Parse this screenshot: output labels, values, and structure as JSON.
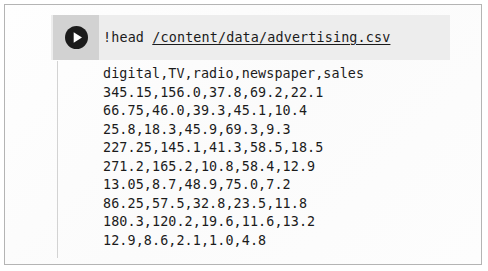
{
  "cell": {
    "run_button": {
      "icon": "play-icon",
      "label": "Run cell"
    },
    "code": {
      "command": "!head ",
      "path": "/content/data/advertising.csv",
      "full": "!head /content/data/advertising.csv"
    },
    "output": {
      "header_line": "digital,TV,radio,newspaper,sales",
      "lines": [
        "digital,TV,radio,newspaper,sales",
        "345.15,156.0,37.8,69.2,22.1",
        "66.75,46.0,39.3,45.1,10.4",
        "25.8,18.3,45.9,69.3,9.3",
        "227.25,145.1,41.3,58.5,18.5",
        "271.2,165.2,10.8,58.4,12.9",
        "13.05,8.7,48.9,75.0,7.2",
        "86.25,57.5,32.8,23.5,11.8",
        "180.3,120.2,19.6,11.6,13.2",
        "12.9,8.6,2.1,1.0,4.8"
      ],
      "columns": [
        "digital",
        "TV",
        "radio",
        "newspaper",
        "sales"
      ],
      "rows": [
        [
          "345.15",
          "156.0",
          "37.8",
          "69.2",
          "22.1"
        ],
        [
          "66.75",
          "46.0",
          "39.3",
          "45.1",
          "10.4"
        ],
        [
          "25.8",
          "18.3",
          "45.9",
          "69.3",
          "9.3"
        ],
        [
          "227.25",
          "145.1",
          "41.3",
          "58.5",
          "18.5"
        ],
        [
          "271.2",
          "165.2",
          "10.8",
          "58.4",
          "12.9"
        ],
        [
          "13.05",
          "8.7",
          "48.9",
          "75.0",
          "7.2"
        ],
        [
          "86.25",
          "57.5",
          "32.8",
          "23.5",
          "11.8"
        ],
        [
          "180.3",
          "120.2",
          "19.6",
          "11.6",
          "13.2"
        ],
        [
          "12.9",
          "8.6",
          "2.1",
          "1.0",
          "4.8"
        ]
      ]
    }
  },
  "colors": {
    "code_band_bg": "#ededed",
    "run_button_bg": "#d2d2d2",
    "text": "#1b1b1b",
    "frame_border": "#b4b4b4",
    "output_rule": "#d3d3d3",
    "page_bg": "#fdfdfd"
  }
}
